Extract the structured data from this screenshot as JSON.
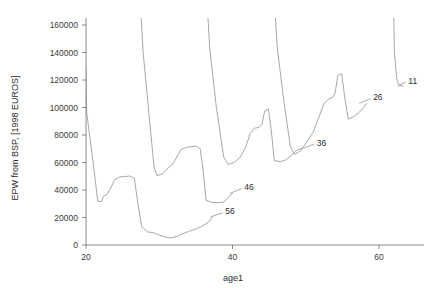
{
  "chart_data": {
    "type": "line",
    "title": "",
    "xlabel": "age1",
    "ylabel": "EPW from BSP, [1998 EUROS]",
    "xlim": [
      18.2,
      64.5
    ],
    "ylim": [
      -4000,
      172000
    ],
    "xticks": [
      20,
      40,
      60
    ],
    "xtick_labels": [
      "20",
      "40",
      "60"
    ],
    "yticks": [
      0,
      20000,
      40000,
      60000,
      80000,
      100000,
      120000,
      140000,
      160000
    ],
    "ytick_labels": [
      "0",
      "20000",
      "40000",
      "60000",
      "80000",
      "100000",
      "120000",
      "140000",
      "160000"
    ],
    "grid": false,
    "legend": "inline-end-labels",
    "series": [
      {
        "name": "56",
        "label": "56",
        "label_x": 39.0,
        "label_y": 24500,
        "leader_from_x": 37.0,
        "leader_from_y": 20500,
        "points": [
          [
            20.0,
            130000
          ],
          [
            20.1,
            96000
          ],
          [
            21.0,
            59000
          ],
          [
            21.6,
            32000
          ],
          [
            22.1,
            31500
          ],
          [
            22.4,
            35500
          ],
          [
            22.8,
            36500
          ],
          [
            23.3,
            40500
          ],
          [
            23.9,
            47500
          ],
          [
            24.6,
            49500
          ],
          [
            25.3,
            49800
          ],
          [
            26.0,
            50200
          ],
          [
            26.6,
            48500
          ],
          [
            27.0,
            33000
          ],
          [
            27.6,
            13500
          ],
          [
            28.4,
            9500
          ],
          [
            29.2,
            9000
          ],
          [
            30.0,
            7200
          ],
          [
            30.8,
            5800
          ],
          [
            31.6,
            5200
          ],
          [
            32.4,
            6200
          ],
          [
            33.2,
            8200
          ],
          [
            34.0,
            9800
          ],
          [
            34.9,
            11500
          ],
          [
            35.8,
            13500
          ],
          [
            36.7,
            16500
          ],
          [
            37.3,
            20500
          ]
        ]
      },
      {
        "name": "46",
        "label": "46",
        "label_x": 41.6,
        "label_y": 42000,
        "leader_from_x": 39.6,
        "leader_from_y": 37500,
        "points": [
          [
            27.5,
            168000
          ],
          [
            27.8,
            140000
          ],
          [
            28.6,
            95000
          ],
          [
            29.3,
            56000
          ],
          [
            29.7,
            50500
          ],
          [
            30.5,
            52000
          ],
          [
            31.2,
            56000
          ],
          [
            31.8,
            58500
          ],
          [
            32.4,
            64000
          ],
          [
            33.0,
            69500
          ],
          [
            33.7,
            71000
          ],
          [
            34.4,
            71500
          ],
          [
            35.0,
            72000
          ],
          [
            35.6,
            70000
          ],
          [
            36.0,
            54000
          ],
          [
            36.4,
            32500
          ],
          [
            37.2,
            31000
          ],
          [
            38.0,
            30800
          ],
          [
            38.8,
            31200
          ],
          [
            39.4,
            34500
          ],
          [
            40.0,
            37500
          ]
        ]
      },
      {
        "name": "36",
        "label": "36",
        "label_x": 51.5,
        "label_y": 74500,
        "leader_from_x": 49.5,
        "leader_from_y": 70000,
        "points": [
          [
            36.6,
            170000
          ],
          [
            36.9,
            142500
          ],
          [
            37.8,
            100000
          ],
          [
            38.8,
            64000
          ],
          [
            39.4,
            58500
          ],
          [
            40.2,
            60000
          ],
          [
            41.0,
            63500
          ],
          [
            41.8,
            71000
          ],
          [
            42.4,
            81000
          ],
          [
            43.0,
            85000
          ],
          [
            43.6,
            85500
          ],
          [
            44.0,
            87500
          ],
          [
            44.4,
            97500
          ],
          [
            44.9,
            99000
          ],
          [
            45.3,
            83000
          ],
          [
            45.7,
            61500
          ],
          [
            46.5,
            60500
          ],
          [
            47.3,
            62000
          ],
          [
            48.1,
            65500
          ],
          [
            48.8,
            69000
          ],
          [
            49.4,
            70000
          ]
        ]
      },
      {
        "name": "26",
        "label": "26",
        "label_x": 59.2,
        "label_y": 107500,
        "leader_from_x": 57.3,
        "leader_from_y": 103000,
        "points": [
          [
            45.8,
            171000
          ],
          [
            46.1,
            144000
          ],
          [
            47.0,
            105000
          ],
          [
            47.9,
            71500
          ],
          [
            48.5,
            66000
          ],
          [
            49.3,
            68500
          ],
          [
            50.1,
            74500
          ],
          [
            51.0,
            82000
          ],
          [
            51.8,
            93000
          ],
          [
            52.5,
            103000
          ],
          [
            53.1,
            106000
          ],
          [
            53.7,
            107500
          ],
          [
            54.0,
            110500
          ],
          [
            54.4,
            123500
          ],
          [
            54.9,
            124500
          ],
          [
            55.3,
            108500
          ],
          [
            55.8,
            91500
          ],
          [
            56.6,
            93500
          ],
          [
            57.3,
            96500
          ],
          [
            57.9,
            100000
          ],
          [
            58.3,
            103000
          ]
        ]
      },
      {
        "name": "11",
        "label": "11",
        "label_x": 64.0,
        "label_y": 119500,
        "leader_from_x": 62.5,
        "leader_from_y": 115500,
        "points": [
          [
            62.0,
            172000
          ],
          [
            62.1,
            140000
          ],
          [
            62.3,
            128500
          ],
          [
            62.4,
            122000
          ],
          [
            62.6,
            117500
          ],
          [
            63.0,
            115800
          ],
          [
            63.3,
            115500
          ]
        ]
      }
    ]
  }
}
